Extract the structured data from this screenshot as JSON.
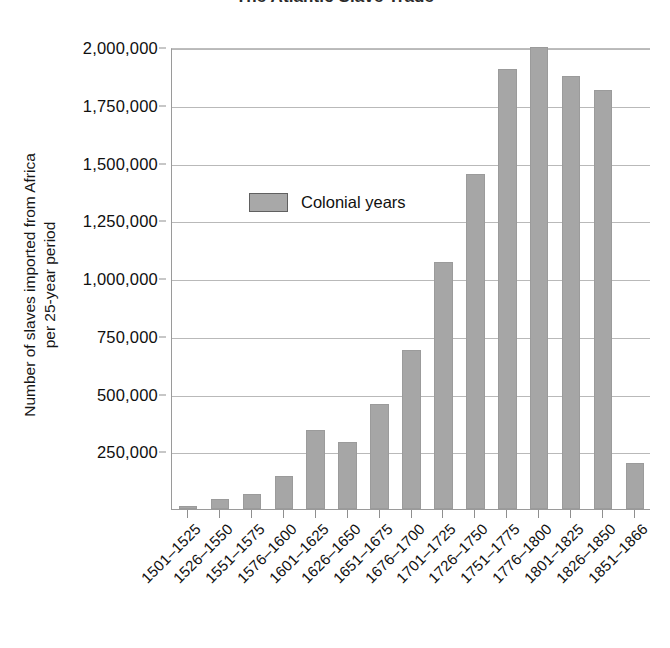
{
  "chart_data": {
    "type": "bar",
    "title": "The Atlantic Slave Trade",
    "xlabel": "",
    "ylabel_line1": "Number of slaves imported from Africa",
    "ylabel_line2": "per 25-year period",
    "ylim": [
      0,
      2000000
    ],
    "ytick_step": 250000,
    "ytick_labels": [
      "2,000,000",
      "1,750,000",
      "1,500,000",
      "1,250,000",
      "1,000,000",
      "750,000",
      "500,000",
      "250,000"
    ],
    "ytick_values": [
      2000000,
      1750000,
      1500000,
      1250000,
      1000000,
      750000,
      500000,
      250000
    ],
    "grid": true,
    "legend_position": "inside-upper-left",
    "legend": [
      {
        "name": "Colonial years",
        "color": "#a6a6a6"
      }
    ],
    "series": [
      {
        "name": "Colonial years",
        "color": "#a6a6a6",
        "values": [
          15000,
          45000,
          65000,
          145000,
          340000,
          290000,
          455000,
          690000,
          1070000,
          1450000,
          1905000,
          2000000,
          1875000,
          1815000,
          200000
        ]
      }
    ],
    "categories": [
      "1501–1525",
      "1526–1550",
      "1551–1575",
      "1576–1600",
      "1601–1625",
      "1626–1650",
      "1651–1675",
      "1676–1700",
      "1701–1725",
      "1726–1750",
      "1751–1775",
      "1776–1800",
      "1801–1825",
      "1826–1850",
      "1851–1866"
    ]
  },
  "colors": {
    "bar_fill": "#a6a6a6",
    "bar_stroke": "#9b9b9b",
    "gridline": "#b9b9b9",
    "axis": "#8f8f8f",
    "text": "#101010",
    "background": "#ffffff"
  }
}
